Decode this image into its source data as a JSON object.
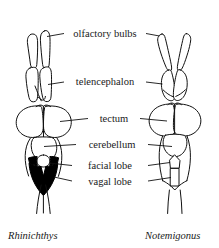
{
  "figure": {
    "background_color": "#ffffff",
    "ink_color": "#111111",
    "fill_highlight_color": "#000000"
  },
  "labels": [
    {
      "id": "olfactory-bulbs",
      "text": "olfactory bulbs",
      "x": 110,
      "y": 37
    },
    {
      "id": "telencephalon",
      "text": "telencephalon",
      "x": 110,
      "y": 85
    },
    {
      "id": "tectum",
      "text": "tectum",
      "x": 110,
      "y": 121
    },
    {
      "id": "cerebellum",
      "text": "cerebellum",
      "x": 110,
      "y": 147
    },
    {
      "id": "facial-lobe",
      "text": "facial lobe",
      "x": 110,
      "y": 169
    },
    {
      "id": "vagal-lobe",
      "text": "vagal lobe",
      "x": 110,
      "y": 185
    }
  ],
  "specimens": [
    {
      "id": "rhinichthys",
      "name": "Rhinichthys",
      "side": "left",
      "x": 28,
      "y": 238
    },
    {
      "id": "notemigonus",
      "name": "Notemigonus",
      "side": "right",
      "x": 152,
      "y": 238
    }
  ],
  "legend_note": {
    "black_region": "vagal lobe and facial lobe shown solid black in Rhinichthys",
    "outlined_region": "vagal lobe and facial lobe shown in outline in Notemigonus"
  }
}
